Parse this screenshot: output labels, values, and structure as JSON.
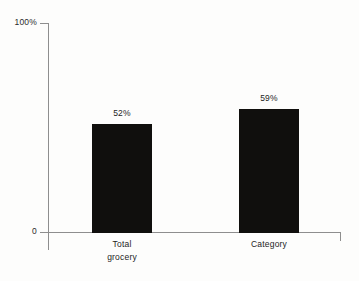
{
  "chart_data": {
    "type": "bar",
    "title": "",
    "subtitle": "",
    "xlabel": "",
    "ylabel": "",
    "categories": [
      "Total grocery",
      "Category"
    ],
    "category_lines": [
      [
        "Total",
        "grocery"
      ],
      [
        "Category"
      ]
    ],
    "values": [
      52,
      59
    ],
    "value_labels": [
      "52%",
      "59%"
    ],
    "ylim": [
      0,
      100
    ],
    "ytick_values": [
      0,
      100
    ],
    "ytick_labels": [
      "0",
      "100%"
    ],
    "grid": false,
    "legend": false,
    "legend_position": "none",
    "bar_color": "#100f0d",
    "axis_color": "#8e8e8e",
    "text_color": "#242424",
    "background_color": "#fdfdfc",
    "annotations": []
  }
}
